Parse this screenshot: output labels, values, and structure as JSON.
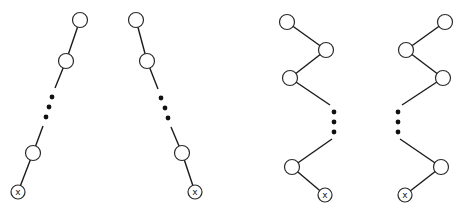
{
  "diagram": {
    "type": "degenerate-tree-chains",
    "node_radius": 7.5,
    "leaf_radius": 7,
    "leaf_label": "x",
    "trees": [
      {
        "name": "left-leaning-chain",
        "nodes": [
          [
            80,
            20
          ],
          [
            66,
            61
          ]
        ],
        "dots": [
          [
            52,
            97
          ],
          [
            49,
            107
          ],
          [
            46,
            117
          ]
        ],
        "lower_nodes": [
          [
            33,
            153
          ]
        ],
        "leaf": [
          18,
          192
        ],
        "segments": [
          [
            [
              80,
              20
            ],
            [
              66,
              61
            ]
          ],
          [
            [
              66,
              61
            ],
            [
              55,
              88
            ]
          ],
          [
            [
              43,
              126
            ],
            [
              33,
              153
            ]
          ],
          [
            [
              33,
              153
            ],
            [
              18,
              192
            ]
          ]
        ]
      },
      {
        "name": "right-leaning-chain",
        "nodes": [
          [
            136,
            20
          ],
          [
            147,
            61
          ]
        ],
        "dots": [
          [
            161,
            98
          ],
          [
            165,
            108
          ],
          [
            168,
            118
          ]
        ],
        "lower_nodes": [
          [
            182,
            153
          ]
        ],
        "leaf": [
          195,
          192
        ],
        "segments": [
          [
            [
              136,
              20
            ],
            [
              147,
              61
            ]
          ],
          [
            [
              147,
              61
            ],
            [
              158,
              89
            ]
          ],
          [
            [
              171,
              127
            ],
            [
              182,
              153
            ]
          ],
          [
            [
              182,
              153
            ],
            [
              195,
              192
            ]
          ]
        ]
      },
      {
        "name": "zigzag-chain-right-first",
        "nodes": [
          [
            287,
            22
          ],
          [
            326,
            50
          ],
          [
            290,
            78
          ]
        ],
        "dots": [
          [
            334,
            112
          ],
          [
            334,
            122
          ],
          [
            334,
            132
          ]
        ],
        "lower_nodes": [
          [
            292,
            167
          ]
        ],
        "leaf": [
          325,
          195
        ],
        "segments": [
          [
            [
              287,
              22
            ],
            [
              326,
              50
            ]
          ],
          [
            [
              326,
              50
            ],
            [
              290,
              78
            ]
          ],
          [
            [
              290,
              78
            ],
            [
              330,
              105
            ]
          ],
          [
            [
              332,
              139
            ],
            [
              292,
              167
            ]
          ],
          [
            [
              292,
              167
            ],
            [
              325,
              195
            ]
          ]
        ]
      },
      {
        "name": "zigzag-chain-left-first",
        "nodes": [
          [
            445,
            22
          ],
          [
            406,
            50
          ],
          [
            443,
            78
          ]
        ],
        "dots": [
          [
            398,
            112
          ],
          [
            398,
            122
          ],
          [
            398,
            132
          ]
        ],
        "lower_nodes": [
          [
            441,
            167
          ]
        ],
        "leaf": [
          405,
          195
        ],
        "segments": [
          [
            [
              445,
              22
            ],
            [
              406,
              50
            ]
          ],
          [
            [
              406,
              50
            ],
            [
              443,
              78
            ]
          ],
          [
            [
              443,
              78
            ],
            [
              402,
              105
            ]
          ],
          [
            [
              400,
              139
            ],
            [
              441,
              167
            ]
          ],
          [
            [
              441,
              167
            ],
            [
              405,
              195
            ]
          ]
        ]
      }
    ]
  }
}
